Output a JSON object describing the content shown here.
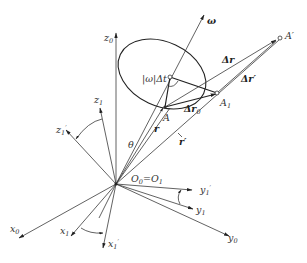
{
  "figure": {
    "type": "kinematics-diagram",
    "labels": {
      "z0": "z",
      "z0_sub": "0",
      "z1": "z",
      "z1_sub": "1",
      "z1p": "z",
      "z1p_sub": "1",
      "z1p_sup": "′",
      "x0": "x",
      "x0_sub": "0",
      "x1": "x",
      "x1_sub": "1",
      "x1p": "x",
      "x1p_sub": "1",
      "x1p_sup": "′",
      "y0": "y",
      "y0_sub": "0",
      "y1": "y",
      "y1_sub": "1",
      "y1p": "y",
      "y1p_sub": "1",
      "y1p_sup": "′",
      "omega": "ω",
      "omega_dt": "|ω|Δt",
      "theta": "θ",
      "r": "r",
      "r_prime": "r′",
      "point_A": "A",
      "point_A1": "A",
      "point_A1_sub": "1",
      "point_A_prime": "A′",
      "delta_r": "Δr",
      "delta_r_prime": "Δr′",
      "delta_r0": "Δr",
      "delta_r0_sub": "0",
      "origin": "O",
      "origin_sub0": "0",
      "origin_eq": "=O",
      "origin_sub1": "1"
    },
    "colors": {
      "line": "#3a3a3a",
      "background": "#ffffff"
    }
  }
}
